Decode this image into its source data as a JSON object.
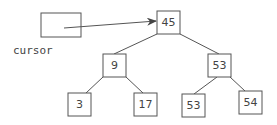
{
  "diagram": {
    "type": "binary-search-tree",
    "cursor": {
      "label": "cursor",
      "points_to": "root"
    },
    "nodes": {
      "root": {
        "value": "45"
      },
      "left": {
        "value": "9"
      },
      "right": {
        "value": "53"
      },
      "left_left": {
        "value": "3"
      },
      "left_right": {
        "value": "17"
      },
      "right_left": {
        "value": "53"
      },
      "right_right": {
        "value": "54"
      }
    },
    "colors": {
      "stroke": "#555555",
      "text": "#444444",
      "background": "#ffffff"
    }
  }
}
